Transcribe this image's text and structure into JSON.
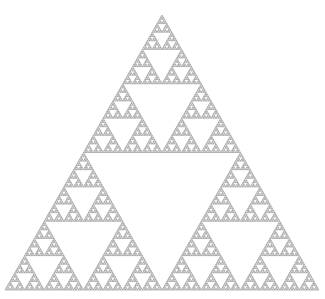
{
  "diagram": {
    "type": "sierpinski-triangle",
    "background": "#ffffff",
    "stroke_color": "#8a8a8a",
    "fill_color": "#ffffff",
    "stroke_width": 0.6,
    "depth": 7,
    "vertices": {
      "apex": [
        162,
        15
      ],
      "bottom_left": [
        5,
        290
      ],
      "bottom_right": [
        319,
        290
      ]
    }
  }
}
